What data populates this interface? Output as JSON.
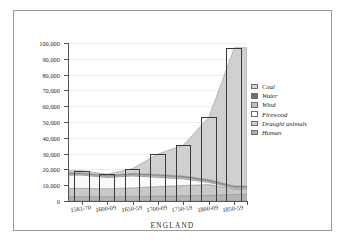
{
  "chart_data": {
    "type": "area",
    "title": "",
    "subtitle": "",
    "xlabel": "ENGLAND",
    "ylabel": "",
    "categories": [
      "1561-70",
      "1600-09",
      "1650-59",
      "1700-09",
      "1750-59",
      "1800-09",
      "1850-59"
    ],
    "ylim": [
      0,
      100000
    ],
    "ytick_values": [
      0,
      10000,
      20000,
      30000,
      40000,
      50000,
      60000,
      70000,
      80000,
      90000,
      100000
    ],
    "ytick_labels": [
      "0",
      "10,000",
      "20,000",
      "30,000",
      "40,000",
      "50,000",
      "60,000",
      "70,000",
      "80,000",
      "90,000",
      "100,000"
    ],
    "grid": true,
    "legend_position": "right",
    "stacked": true,
    "series": [
      {
        "name": "Human",
        "color": "#b4b4b4",
        "values": [
          2800,
          2700,
          2900,
          3100,
          3300,
          3600,
          4200
        ]
      },
      {
        "name": "Draught animals",
        "color": "#c9c9c9",
        "values": [
          5200,
          5100,
          5400,
          6100,
          6500,
          6800,
          3400
        ]
      },
      {
        "name": "Firewood",
        "color": "#fafafa",
        "values": [
          8400,
          7100,
          7600,
          5800,
          4200,
          1400,
          600
        ]
      },
      {
        "name": "Wind",
        "color": "#bdbdbd",
        "values": [
          900,
          900,
          1000,
          1100,
          1100,
          900,
          600
        ]
      },
      {
        "name": "Water",
        "color": "#8c8c8c",
        "values": [
          500,
          500,
          600,
          700,
          800,
          900,
          700
        ]
      },
      {
        "name": "Coal",
        "color": "#d0d0d0",
        "values": [
          1400,
          700,
          3000,
          13000,
          19500,
          39400,
          87500
        ]
      }
    ],
    "bar_totals": [
      19200,
      17000,
      20500,
      29800,
      35400,
      53000,
      97000
    ],
    "legend": [
      {
        "label": "Coal",
        "color": "#d5d5d5"
      },
      {
        "label": "Water",
        "color": "#6f6f6f"
      },
      {
        "label": "Wind",
        "color": "#c2c2c2"
      },
      {
        "label": "Firewood",
        "color": "#ffffff"
      },
      {
        "label": "Draught animals",
        "color": "#cfcfcf"
      },
      {
        "label": "Human",
        "color": "#b0b0b0"
      }
    ]
  }
}
